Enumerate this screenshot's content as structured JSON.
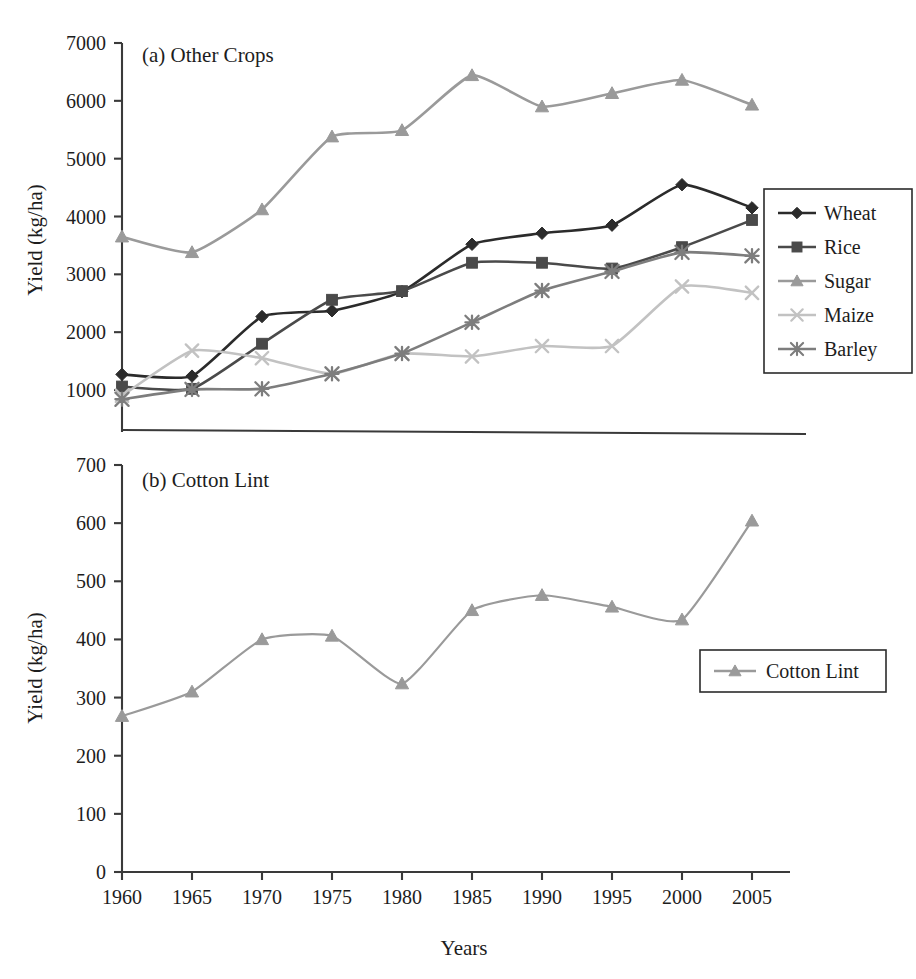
{
  "figure": {
    "background_color": "#ffffff",
    "panels": [
      {
        "id": "panel-a",
        "title": "(a) Other Crops",
        "ylabel": "Yield (kg/ha)",
        "xlabel": "",
        "ytick_labels": [
          "7000",
          "6000",
          "5000",
          "4000",
          "3000",
          "2000",
          "1000"
        ],
        "xtick_labels": []
      },
      {
        "id": "panel-b",
        "title": "(b) Cotton Lint",
        "ylabel": "Yield (kg/ha)",
        "xlabel": "Years",
        "ytick_labels": [
          "700",
          "600",
          "500",
          "400",
          "300",
          "200",
          "100",
          "0"
        ],
        "xtick_labels": [
          "1960",
          "1965",
          "1970",
          "1975",
          "1980",
          "1985",
          "1990",
          "1995",
          "2000",
          "2005"
        ]
      }
    ]
  },
  "chart_data": [
    {
      "id": "panel-a",
      "type": "line",
      "title": "(a) Other Crops",
      "xlabel": "",
      "ylabel": "Yield (kg/ha)",
      "x": [
        1960,
        1965,
        1970,
        1975,
        1980,
        1985,
        1990,
        1995,
        2000,
        2005
      ],
      "xlim": [
        1960,
        2005
      ],
      "ylim": [
        600,
        7000
      ],
      "ytick_values": [
        7000,
        6000,
        5000,
        4000,
        3000,
        2000,
        1000
      ],
      "xtick_values": [
        1960,
        1965,
        1970,
        1975,
        1980,
        1985,
        1990,
        1995,
        2000,
        2005
      ],
      "grid": false,
      "legend_position": "right",
      "series": [
        {
          "name": "Wheat",
          "marker": "diamond",
          "color": "#2b2b2b",
          "values": [
            1270,
            1240,
            2270,
            2370,
            2700,
            3520,
            3710,
            3850,
            4550,
            4150
          ]
        },
        {
          "name": "Rice",
          "marker": "square",
          "color": "#4a4a4a",
          "values": [
            1060,
            1020,
            1800,
            2560,
            2710,
            3200,
            3200,
            3100,
            3470,
            3940
          ]
        },
        {
          "name": "Sugar",
          "marker": "triangle",
          "color": "#9a9a9a",
          "values": [
            3650,
            3380,
            4120,
            5380,
            5490,
            6440,
            5900,
            6130,
            6360,
            5930
          ]
        },
        {
          "name": "Maize",
          "marker": "cross",
          "color": "#c2c2c2",
          "values": [
            900,
            1680,
            1550,
            1280,
            1630,
            1580,
            1760,
            1760,
            2790,
            2680
          ]
        },
        {
          "name": "Barley",
          "marker": "asterisk",
          "color": "#7d7d7d",
          "values": [
            840,
            1010,
            1020,
            1280,
            1630,
            2170,
            2720,
            3050,
            3380,
            3320
          ]
        }
      ]
    },
    {
      "id": "panel-b",
      "type": "line",
      "title": "(b) Cotton Lint",
      "xlabel": "Years",
      "ylabel": "Yield (kg/ha)",
      "x": [
        1960,
        1965,
        1970,
        1975,
        1980,
        1985,
        1990,
        1995,
        2000,
        2005
      ],
      "xlim": [
        1960,
        2005
      ],
      "ylim": [
        0,
        700
      ],
      "ytick_values": [
        700,
        600,
        500,
        400,
        300,
        200,
        100,
        0
      ],
      "xtick_values": [
        1960,
        1965,
        1970,
        1975,
        1980,
        1985,
        1990,
        1995,
        2000,
        2005
      ],
      "grid": false,
      "legend_position": "right",
      "series": [
        {
          "name": "Cotton Lint",
          "marker": "triangle",
          "color": "#9a9a9a",
          "values": [
            268,
            310,
            400,
            406,
            324,
            450,
            476,
            456,
            434,
            604
          ]
        }
      ]
    }
  ]
}
